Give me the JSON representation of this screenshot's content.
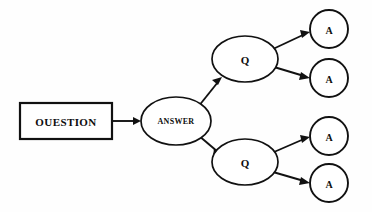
{
  "diagram": {
    "background_color": "#fefefe",
    "stroke_color": "#111111",
    "fill_color": "#ffffff",
    "nodes": {
      "root": {
        "label": "OUESTION",
        "shape": "rectangle",
        "x": 20,
        "y": 103,
        "width": 92,
        "height": 36
      },
      "answer": {
        "label": "ANSWER",
        "shape": "ellipse",
        "cx": 176,
        "cy": 121,
        "rx": 35,
        "ry": 24
      },
      "question_top": {
        "label": "Q",
        "shape": "ellipse",
        "cx": 245,
        "cy": 59,
        "rx": 33,
        "ry": 23
      },
      "question_bottom": {
        "label": "Q",
        "shape": "ellipse",
        "cx": 245,
        "cy": 162,
        "rx": 33,
        "ry": 23
      },
      "answer_1": {
        "label": "A",
        "shape": "circle",
        "cx": 329,
        "cy": 29,
        "r": 19
      },
      "answer_2": {
        "label": "A",
        "shape": "circle",
        "cx": 329,
        "cy": 78,
        "r": 19
      },
      "answer_3": {
        "label": "A",
        "shape": "circle",
        "cx": 329,
        "cy": 136,
        "r": 19
      },
      "answer_4": {
        "label": "A",
        "shape": "circle",
        "cx": 329,
        "cy": 183,
        "r": 19
      }
    },
    "edges": [
      {
        "name": "question-to-answer",
        "from": "root",
        "to": "answer"
      },
      {
        "name": "answer-to-question-top",
        "from": "answer",
        "to": "question_top"
      },
      {
        "name": "answer-to-question-bottom",
        "from": "answer",
        "to": "question_bottom"
      },
      {
        "name": "question-top-to-answer-1",
        "from": "question_top",
        "to": "answer_1"
      },
      {
        "name": "question-top-to-answer-2",
        "from": "question_top",
        "to": "answer_2"
      },
      {
        "name": "question-bottom-to-answer-3",
        "from": "question_bottom",
        "to": "answer_3"
      },
      {
        "name": "question-bottom-to-answer-4",
        "from": "question_bottom",
        "to": "answer_4"
      }
    ]
  }
}
